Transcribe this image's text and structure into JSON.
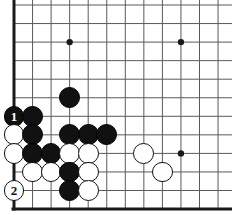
{
  "diagram": {
    "kind": "go-board-diagram",
    "board": {
      "visible_columns": 12,
      "visible_rows": 12,
      "origin_x": 14,
      "origin_y": 5,
      "spacing": 18.55,
      "line_color": "#5a5a5a",
      "edge_color": "#1a1a1a",
      "background_color": "#ffffff",
      "edges": [
        "left",
        "bottom"
      ],
      "star_points": [
        {
          "col": 4,
          "row": 3
        },
        {
          "col": 10,
          "row": 3
        },
        {
          "col": 10,
          "row": 9
        }
      ]
    },
    "stones": [
      {
        "col": 4,
        "row": 6,
        "color": "black",
        "label": ""
      },
      {
        "col": 1,
        "row": 7,
        "color": "black",
        "label": "1"
      },
      {
        "col": 2,
        "row": 7,
        "color": "black",
        "label": ""
      },
      {
        "col": 1,
        "row": 8,
        "color": "white",
        "label": ""
      },
      {
        "col": 2,
        "row": 8,
        "color": "black",
        "label": ""
      },
      {
        "col": 4,
        "row": 8,
        "color": "black",
        "label": ""
      },
      {
        "col": 5,
        "row": 8,
        "color": "black",
        "label": ""
      },
      {
        "col": 6,
        "row": 8,
        "color": "black",
        "label": ""
      },
      {
        "col": 1,
        "row": 9,
        "color": "white",
        "label": ""
      },
      {
        "col": 2,
        "row": 9,
        "color": "black",
        "label": ""
      },
      {
        "col": 3,
        "row": 9,
        "color": "black",
        "label": ""
      },
      {
        "col": 4,
        "row": 9,
        "color": "white",
        "label": ""
      },
      {
        "col": 5,
        "row": 9,
        "color": "white",
        "label": ""
      },
      {
        "col": 8,
        "row": 9,
        "color": "white",
        "label": ""
      },
      {
        "col": 2,
        "row": 10,
        "color": "white",
        "label": ""
      },
      {
        "col": 3,
        "row": 10,
        "color": "white",
        "label": ""
      },
      {
        "col": 4,
        "row": 10,
        "color": "black",
        "label": ""
      },
      {
        "col": 5,
        "row": 10,
        "color": "white",
        "label": ""
      },
      {
        "col": 9,
        "row": 10,
        "color": "white",
        "label": ""
      },
      {
        "col": 1,
        "row": 11,
        "color": "white",
        "label": "2"
      },
      {
        "col": 4,
        "row": 11,
        "color": "black",
        "label": ""
      },
      {
        "col": 5,
        "row": 11,
        "color": "white",
        "label": ""
      }
    ],
    "move_numbers": [
      {
        "number": "1",
        "color": "black"
      },
      {
        "number": "2",
        "color": "white"
      }
    ]
  }
}
